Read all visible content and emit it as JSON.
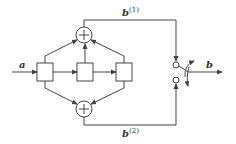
{
  "diagram": {
    "type": "block-diagram",
    "input_label": "a",
    "output_label": "b",
    "branch_top": {
      "base": "b",
      "superscript": "(1)"
    },
    "branch_bottom": {
      "base": "b",
      "superscript": "(2)"
    },
    "blocks": [
      {
        "id": "block-1"
      },
      {
        "id": "block-2"
      },
      {
        "id": "block-3"
      }
    ],
    "adders": [
      {
        "id": "adder-top",
        "symbol": "+"
      },
      {
        "id": "adder-bottom",
        "symbol": "+"
      }
    ],
    "switch": {
      "contacts": 2,
      "output": "b"
    },
    "colors": {
      "stroke": "#444444",
      "background": "#ffffff"
    }
  }
}
